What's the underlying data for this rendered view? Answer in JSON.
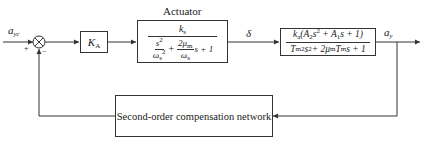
{
  "diagram": {
    "type": "control-loop block diagram",
    "signals": {
      "input": "a",
      "input_sub": "yc",
      "plus_sign": "+",
      "minus_sign": "−",
      "actuator_output": "δ",
      "output": "a",
      "output_sub": "y"
    },
    "blocks": {
      "gain": {
        "label": "K",
        "sub": "A"
      },
      "actuator": {
        "title": "Actuator",
        "numerator": {
          "k": "k",
          "k_sub": "s"
        },
        "denominator": {
          "t1_num": "s",
          "t1_num_sup": "2",
          "t1_den": "ω",
          "t1_den_sub": "s",
          "t1_den_sup": "2",
          "plus": "+",
          "t2_num": "2μ",
          "t2_num_sub": "m",
          "t2_den": "ω",
          "t2_den_sub": "s",
          "tail": "s + 1"
        }
      },
      "plant": {
        "numerator": "k_a(A_2 s^2 + A_1 s + 1)",
        "denominator": "T_m^2 s^2 + 2 μ_m T_m s + 1"
      },
      "feedback": {
        "label": "Second-order compensation network"
      }
    },
    "colors": {
      "line": "#333333",
      "background": "#ffffff"
    }
  }
}
